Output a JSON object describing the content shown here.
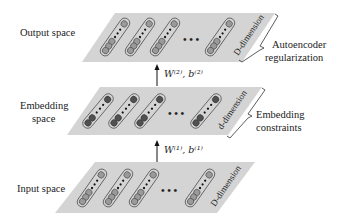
{
  "diagram": {
    "colors": {
      "plane": "#d4d4d4",
      "node_light": "#9a9a9a",
      "node_dark": "#505050",
      "capsule_stroke": "#555555",
      "text": "#222222"
    },
    "layers": [
      {
        "id": "output",
        "label": "Output space",
        "dimension_label": "D-dimension",
        "bracket_label_line1": "Autoencoder",
        "bracket_label_line2": "regularization",
        "node_style": "light"
      },
      {
        "id": "embedding",
        "label_line1": "Embedding",
        "label_line2": "space",
        "dimension_label": "d-dimension",
        "bracket_label_line1": "Embedding",
        "bracket_label_line2": "constraints",
        "node_style": "dark"
      },
      {
        "id": "input",
        "label": "Input space",
        "dimension_label": "D-dimension",
        "node_style": "light"
      }
    ],
    "arrows": [
      {
        "from": "input",
        "to": "embedding",
        "label": "W⁽¹⁾, b⁽¹⁾"
      },
      {
        "from": "embedding",
        "to": "output",
        "label": "W⁽²⁾, b⁽²⁾"
      }
    ],
    "ellipsis": "• • •"
  }
}
